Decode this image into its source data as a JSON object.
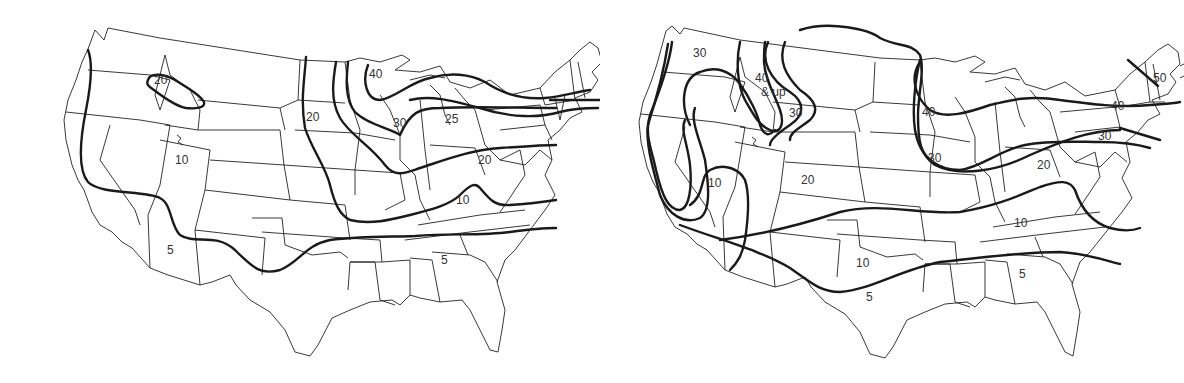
{
  "maps": [
    {
      "id": "left",
      "labels": [
        {
          "text": "20",
          "x": 162,
          "y": 80
        },
        {
          "text": "20",
          "x": 314,
          "y": 117
        },
        {
          "text": "40",
          "x": 377,
          "y": 74
        },
        {
          "text": "30",
          "x": 401,
          "y": 123
        },
        {
          "text": "25",
          "x": 453,
          "y": 119
        },
        {
          "text": "20",
          "x": 486,
          "y": 160
        },
        {
          "text": "10",
          "x": 183,
          "y": 160
        },
        {
          "text": "10",
          "x": 464,
          "y": 200
        },
        {
          "text": "5",
          "x": 175,
          "y": 250
        },
        {
          "text": "5",
          "x": 449,
          "y": 260
        }
      ]
    },
    {
      "id": "right",
      "labels": [
        {
          "text": "30",
          "x": 701,
          "y": 53
        },
        {
          "text": "40",
          "x": 763,
          "y": 78
        },
        {
          "text": "& up",
          "x": 769,
          "y": 92
        },
        {
          "text": "30",
          "x": 797,
          "y": 113
        },
        {
          "text": "40",
          "x": 930,
          "y": 112
        },
        {
          "text": "30",
          "x": 936,
          "y": 158
        },
        {
          "text": "20",
          "x": 1045,
          "y": 165
        },
        {
          "text": "40",
          "x": 1119,
          "y": 106
        },
        {
          "text": "30",
          "x": 1106,
          "y": 136
        },
        {
          "text": "50",
          "x": 1161,
          "y": 78
        },
        {
          "text": "10",
          "x": 716,
          "y": 183
        },
        {
          "text": "20",
          "x": 809,
          "y": 180
        },
        {
          "text": "10",
          "x": 1022,
          "y": 223
        },
        {
          "text": "10",
          "x": 864,
          "y": 263
        },
        {
          "text": "5",
          "x": 1027,
          "y": 274
        },
        {
          "text": "5",
          "x": 874,
          "y": 297
        }
      ]
    }
  ]
}
